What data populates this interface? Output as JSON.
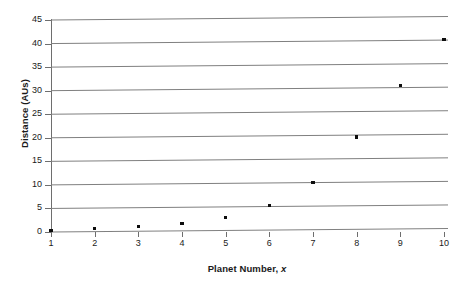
{
  "chart_data": {
    "type": "scatter",
    "title": "",
    "subtitle": "",
    "xlabel_prefix": "Planet Number, ",
    "xlabel_italic": "x",
    "xlabel": "Planet Number, x",
    "ylabel": "Distance (AUs)",
    "xlim": [
      1,
      10
    ],
    "ylim": [
      0,
      45
    ],
    "grid": "horizontal",
    "legend": "none",
    "x_ticks": [
      1,
      2,
      3,
      4,
      5,
      6,
      7,
      8,
      9,
      10
    ],
    "x_tick_labels": [
      "1",
      "2",
      "3",
      "4",
      "5",
      "6",
      "7",
      "8",
      "9",
      "10"
    ],
    "y_ticks": [
      0,
      5,
      10,
      15,
      20,
      25,
      30,
      35,
      40,
      45
    ],
    "y_tick_labels": [
      "0",
      "5",
      "10",
      "15",
      "20",
      "25",
      "30",
      "35",
      "40",
      "45"
    ],
    "marker": "square",
    "marker_color": "#0d0d0d",
    "gridline_color": "#808080",
    "axis_color": "#6e6e6e",
    "x": [
      1,
      2,
      3,
      4,
      5,
      6,
      7,
      8,
      9,
      10
    ],
    "values": [
      0.4,
      0.7,
      1.0,
      1.6,
      2.8,
      5.2,
      10.0,
      19.6,
      30.4,
      40.2
    ],
    "points": [
      {
        "x": 1,
        "y": 0.4
      },
      {
        "x": 2,
        "y": 0.7
      },
      {
        "x": 3,
        "y": 1.0
      },
      {
        "x": 4,
        "y": 1.6
      },
      {
        "x": 5,
        "y": 2.8
      },
      {
        "x": 6,
        "y": 5.2
      },
      {
        "x": 7,
        "y": 10.0
      },
      {
        "x": 8,
        "y": 19.6
      },
      {
        "x": 9,
        "y": 30.4
      },
      {
        "x": 10,
        "y": 40.2
      }
    ]
  }
}
